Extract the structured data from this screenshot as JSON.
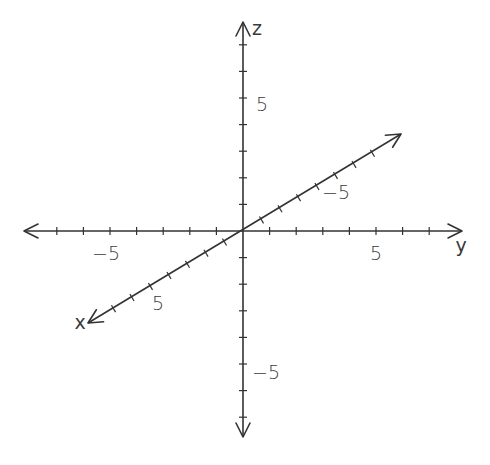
{
  "diagram": {
    "title": "3D coordinate axes",
    "origin": [
      243,
      231
    ],
    "unit_px": 26.6,
    "ticks_per_side": 7,
    "axes": {
      "x": {
        "label": "x",
        "direction_per_unit": [
          -18.5,
          11.1
        ],
        "positive_end": [
          88,
          323
        ],
        "negative_end": [
          401,
          134
        ],
        "labels": [
          {
            "value": 5,
            "text": "5",
            "pos": [
              158,
              303
            ]
          },
          {
            "value": -5,
            "text": "−5",
            "pos": [
              336,
              192
            ]
          }
        ],
        "name_pos": [
          80,
          323
        ]
      },
      "y": {
        "label": "y",
        "direction_per_unit": [
          26.6,
          0
        ],
        "positive_end": [
          462,
          231
        ],
        "negative_end": [
          24,
          231
        ],
        "labels": [
          {
            "value": 5,
            "text": "5",
            "pos": [
              376,
              253
            ]
          },
          {
            "value": -5,
            "text": "−5",
            "pos": [
              106,
              253
            ]
          }
        ],
        "name_pos": [
          461,
          246
        ]
      },
      "z": {
        "label": "z",
        "direction_per_unit": [
          0,
          -26.6
        ],
        "positive_end": [
          243,
          22
        ],
        "negative_end": [
          243,
          437
        ],
        "labels": [
          {
            "value": 5,
            "text": "5",
            "pos": [
              262,
              104
            ]
          },
          {
            "value": -5,
            "text": "−5",
            "pos": [
              266,
              372
            ]
          }
        ],
        "name_pos": [
          257,
          29
        ]
      }
    },
    "colors": {
      "axis": "#333333",
      "text": "#3a3a3a",
      "background": "#ffffff"
    }
  }
}
